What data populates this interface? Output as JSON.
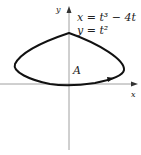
{
  "figure": {
    "equation_line1": "x = t³ − 4t",
    "equation_line2": "y = t²",
    "region_label": "A",
    "x_axis_label": "x",
    "y_axis_label": "y"
  },
  "colors": {
    "curve": "#111111",
    "axes": "#777777",
    "text": "#222222"
  }
}
